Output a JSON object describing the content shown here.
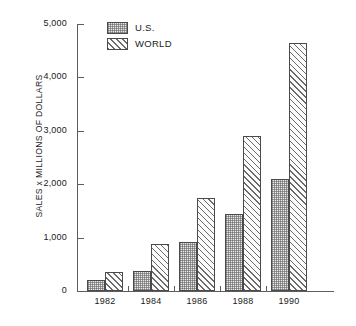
{
  "chart_data": {
    "type": "bar",
    "title": "",
    "subtitle": "",
    "xlabel": "",
    "ylabel": "SALES x MILLIONS OF DOLLARS",
    "categories": [
      "1982",
      "1984",
      "1986",
      "1988",
      "1990"
    ],
    "series": [
      {
        "name": "U.S.",
        "values": [
          200,
          380,
          920,
          1440,
          2100
        ]
      },
      {
        "name": "WORLD",
        "values": [
          360,
          880,
          1750,
          2900,
          4650
        ]
      }
    ],
    "ylim": [
      0,
      5000
    ],
    "ytick_labels": [
      "0",
      "1,000",
      "2,000",
      "3,000",
      "4,000",
      "5,000"
    ],
    "ytick_values": [
      0,
      1000,
      2000,
      3000,
      4000,
      5000
    ],
    "grid": false,
    "legend_position": "top-left",
    "legend": [
      {
        "label": "U.S.",
        "pattern": "stipple"
      },
      {
        "label": "WORLD",
        "pattern": "diagonal-hatch"
      }
    ],
    "colors": {
      "axis": "#5d5d5d",
      "bar_outline": "#4a4a4a",
      "us_fill": "#e8e8e8",
      "world_fill": "#fbfbfb",
      "hatch": "#6a6a6a",
      "text": "#1a1a1a",
      "background": "#ffffff"
    }
  }
}
